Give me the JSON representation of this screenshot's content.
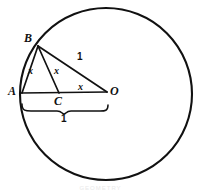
{
  "figure": {
    "type": "geometry-diagram",
    "background_color": "#ffffff",
    "stroke_color": "#111111",
    "points": [
      {
        "id": "A",
        "label": "A",
        "x": 22,
        "y": 93,
        "label_x": 9,
        "label_y": 86,
        "on": "circle"
      },
      {
        "id": "B",
        "label": "B",
        "x": 38,
        "y": 46,
        "label_x": 25,
        "label_y": 33,
        "on": "circle"
      },
      {
        "id": "C",
        "label": "C",
        "x": 59,
        "y": 93,
        "label_x": 55,
        "label_y": 96,
        "on": "segment-AO"
      },
      {
        "id": "O",
        "label": "O",
        "x": 107,
        "y": 92,
        "label_x": 111,
        "label_y": 86,
        "on": "center"
      }
    ],
    "circle": {
      "cx": 106,
      "cy": 94,
      "r": 86
    },
    "segments": [
      {
        "id": "AB",
        "from": "A",
        "to": "B"
      },
      {
        "id": "BC",
        "from": "B",
        "to": "C"
      },
      {
        "id": "BO",
        "from": "B",
        "to": "O"
      },
      {
        "id": "AO",
        "from": "A",
        "to": "O"
      }
    ],
    "measure_labels": [
      {
        "id": "x-on-AB",
        "text": "x",
        "x": 29,
        "y": 67
      },
      {
        "id": "x-on-BC",
        "text": "x",
        "x": 55,
        "y": 67
      },
      {
        "id": "x-on-CO",
        "text": "x",
        "x": 79,
        "y": 83
      },
      {
        "id": "one-on-BO",
        "text": "1",
        "x": 78,
        "y": 53
      },
      {
        "id": "one-under-AO",
        "text": "1",
        "x": 62,
        "y": 115
      }
    ],
    "brace": {
      "id": "brace-AO",
      "from_x": 22,
      "to_x": 108,
      "y": 106,
      "spans": "AO",
      "value": "1"
    },
    "caption": "GEOMETRY"
  }
}
